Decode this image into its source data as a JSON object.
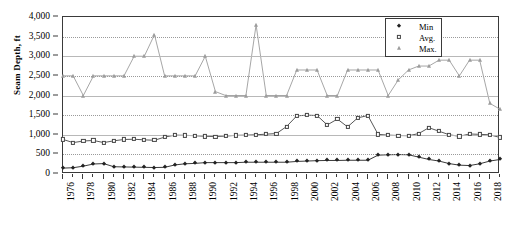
{
  "chart_data": {
    "type": "line",
    "title": "",
    "xlabel": "",
    "ylabel": "Seam Depth, ft",
    "ylim": [
      0,
      4000
    ],
    "ytick_labels": [
      "0",
      "500",
      "1,000",
      "1,500",
      "2,000",
      "2,500",
      "3,000",
      "3,500",
      "4,000"
    ],
    "ytick_values": [
      0,
      500,
      1000,
      1500,
      2000,
      2500,
      3000,
      3500,
      4000
    ],
    "xlim": [
      1976,
      2019
    ],
    "x": [
      1976,
      1977,
      1978,
      1979,
      1980,
      1981,
      1982,
      1983,
      1984,
      1985,
      1986,
      1987,
      1988,
      1989,
      1990,
      1991,
      1992,
      1993,
      1994,
      1995,
      1996,
      1997,
      1998,
      1999,
      2000,
      2001,
      2002,
      2003,
      2004,
      2005,
      2006,
      2007,
      2008,
      2009,
      2010,
      2011,
      2012,
      2013,
      2014,
      2015,
      2016,
      2017,
      2018,
      2019
    ],
    "xtick_labels": [
      "1976",
      "1978",
      "1980",
      "1982",
      "1984",
      "1986",
      "1988",
      "1990",
      "1992",
      "1994",
      "1996",
      "1998",
      "2000",
      "2002",
      "2004",
      "2006",
      "2008",
      "2010",
      "2012",
      "2014",
      "2016",
      "2018"
    ],
    "xtick_values": [
      1976,
      1978,
      1980,
      1982,
      1984,
      1986,
      1988,
      1990,
      1992,
      1994,
      1996,
      1998,
      2000,
      2002,
      2004,
      2006,
      2008,
      2010,
      2012,
      2014,
      2016,
      2018
    ],
    "grid": true,
    "legend_position": "top-right",
    "series": [
      {
        "name": "Min",
        "marker": "filled-diamond",
        "color": "#222222",
        "values": [
          150,
          160,
          200,
          255,
          265,
          185,
          180,
          175,
          170,
          165,
          170,
          230,
          260,
          270,
          290,
          290,
          290,
          290,
          300,
          300,
          300,
          300,
          300,
          320,
          330,
          340,
          345,
          345,
          350,
          350,
          350,
          480,
          490,
          495,
          490,
          430,
          370,
          330,
          265,
          225,
          215,
          260,
          330,
          370
        ]
      },
      {
        "name": "Avg.",
        "marker": "open-square",
        "color": "#444444",
        "values": [
          880,
          800,
          840,
          855,
          800,
          845,
          880,
          885,
          870,
          860,
          940,
          990,
          985,
          975,
          960,
          955,
          965,
          985,
          990,
          1000,
          1015,
          1030,
          1210,
          1480,
          1500,
          1490,
          1250,
          1400,
          1200,
          1430,
          1490,
          1010,
          990,
          980,
          975,
          1030,
          1180,
          1090,
          1000,
          960,
          1020,
          1010,
          1000,
          930
        ]
      },
      {
        "name": "Max.",
        "marker": "triangle",
        "color": "#9c9c9c",
        "values": [
          2500,
          2500,
          2000,
          2500,
          2500,
          2500,
          2500,
          3000,
          3000,
          3550,
          2500,
          2500,
          2500,
          2500,
          3000,
          2100,
          2000,
          2000,
          2000,
          3800,
          2000,
          2000,
          2000,
          2650,
          2650,
          2650,
          2000,
          2000,
          2650,
          2650,
          2650,
          2650,
          2000,
          2400,
          2650,
          2750,
          2750,
          2900,
          2900,
          2500,
          2900,
          2900,
          1800,
          1650
        ]
      }
    ]
  },
  "legend": {
    "entries": [
      {
        "label": "Min"
      },
      {
        "label": "Avg."
      },
      {
        "label": "Max."
      }
    ]
  }
}
